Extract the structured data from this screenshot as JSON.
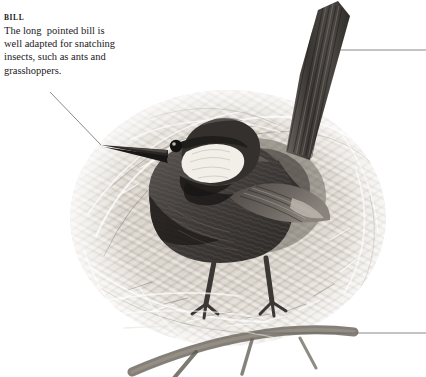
{
  "plate": {
    "title": "bird-at-nest-illustration",
    "medium": "grayscale-pencil-illustration",
    "background_color": "#ffffff"
  },
  "callout": {
    "heading": "BILL",
    "lines": [
      "The long  pointed bill is",
      "well adapted for snatching",
      "insects, such as ants and",
      "grasshoppers."
    ],
    "text_color": "#23201d",
    "heading_color": "#1c1a18"
  },
  "leaders": {
    "color": "#6b6b6b",
    "items": [
      {
        "name": "bill-leader",
        "kind": "diagonal",
        "x1": 50,
        "y1": 92,
        "x2": 101,
        "y2": 145
      },
      {
        "name": "tail-leader",
        "kind": "horizontal",
        "x1": 340,
        "y1": 50,
        "x2": 426,
        "y2": 50
      },
      {
        "name": "nest-leader",
        "kind": "horizontal",
        "x1": 255,
        "y1": 333,
        "x2": 426,
        "y2": 333
      }
    ]
  },
  "subject": {
    "bird": {
      "name": "perching-bird",
      "plumage_color": "#4a4643",
      "dark_accent_color": "#24211f",
      "cheek_patch_color": "#f2efe9",
      "eye_color": "#141211",
      "bill_color": "#2a2725",
      "leg_color": "#3a3734"
    },
    "nest": {
      "name": "domed-straw-nest",
      "straw_light_color": "#e8e4dc",
      "straw_mid_color": "#b9b3a9",
      "straw_dark_color": "#7d776e"
    },
    "perch": {
      "name": "twig-perch",
      "color": "#6e6860"
    }
  }
}
